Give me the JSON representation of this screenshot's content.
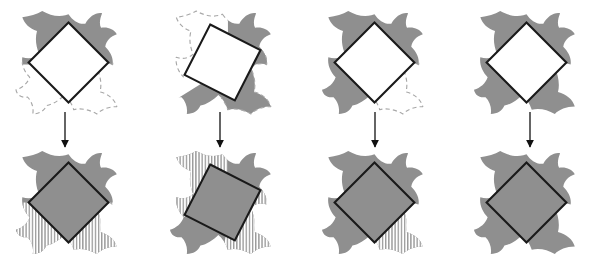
{
  "figure": {
    "title": "",
    "columns": 4,
    "rows": 2,
    "background_color": "#ffffff",
    "fill_color": "#8f8f8f",
    "outline_color": "#1a1a1a",
    "dash_color": "#a8a8a8",
    "hatch_color": "#9a9a9a",
    "arrow_color": "#111111"
  },
  "panels": [
    {
      "id": "panel-1",
      "column": 1,
      "top": {
        "label": "",
        "diamond_rotation_deg": 0,
        "diamond_fill": "#ffffff",
        "filled_lobes": [
          "top-left",
          "top-right"
        ],
        "dashed_lobes": [
          "bottom-left",
          "bottom-right"
        ]
      },
      "bottom": {
        "label": "",
        "diamond_rotation_deg": 0,
        "diamond_fill": "#8f8f8f",
        "filled_lobes": [
          "top-left",
          "top-right",
          "bottom-left",
          "bottom-right"
        ],
        "hatched_lobes": [
          "bottom-left",
          "bottom-right"
        ]
      },
      "arrow": {
        "name": "down-arrow",
        "direction": "down"
      }
    },
    {
      "id": "panel-2",
      "column": 2,
      "top": {
        "label": "",
        "diamond_rotation_deg": -18,
        "diamond_fill": "#ffffff",
        "filled_lobes": [
          "bottom-left",
          "top-right"
        ],
        "dashed_lobes": [
          "top-left",
          "bottom-right"
        ]
      },
      "bottom": {
        "label": "",
        "diamond_rotation_deg": -18,
        "diamond_fill": "#8f8f8f",
        "filled_lobes": [
          "top-left",
          "top-right",
          "bottom-left",
          "bottom-right"
        ],
        "hatched_lobes": [
          "top-left",
          "bottom-right"
        ]
      },
      "arrow": {
        "name": "down-arrow",
        "direction": "down"
      }
    },
    {
      "id": "panel-3",
      "column": 3,
      "top": {
        "label": "",
        "diamond_rotation_deg": 0,
        "diamond_fill": "#ffffff",
        "filled_lobes": [
          "top-left",
          "top-right",
          "bottom-left"
        ],
        "dashed_lobes": [
          "bottom-right"
        ]
      },
      "bottom": {
        "label": "",
        "diamond_rotation_deg": 0,
        "diamond_fill": "#8f8f8f",
        "filled_lobes": [
          "top-left",
          "top-right",
          "bottom-left",
          "bottom-right"
        ],
        "hatched_lobes": [
          "bottom-right"
        ]
      },
      "arrow": {
        "name": "down-arrow",
        "direction": "down"
      }
    },
    {
      "id": "panel-4",
      "column": 4,
      "top": {
        "label": "",
        "diamond_rotation_deg": 0,
        "diamond_fill": "#ffffff",
        "filled_lobes": [
          "top-left",
          "top-right",
          "bottom-left",
          "bottom-right"
        ],
        "dashed_lobes": []
      },
      "bottom": {
        "label": "",
        "diamond_rotation_deg": 0,
        "diamond_fill": "#8f8f8f",
        "filled_lobes": [
          "top-left",
          "top-right",
          "bottom-left",
          "bottom-right"
        ],
        "hatched_lobes": []
      },
      "arrow": {
        "name": "down-arrow",
        "direction": "down"
      }
    }
  ]
}
